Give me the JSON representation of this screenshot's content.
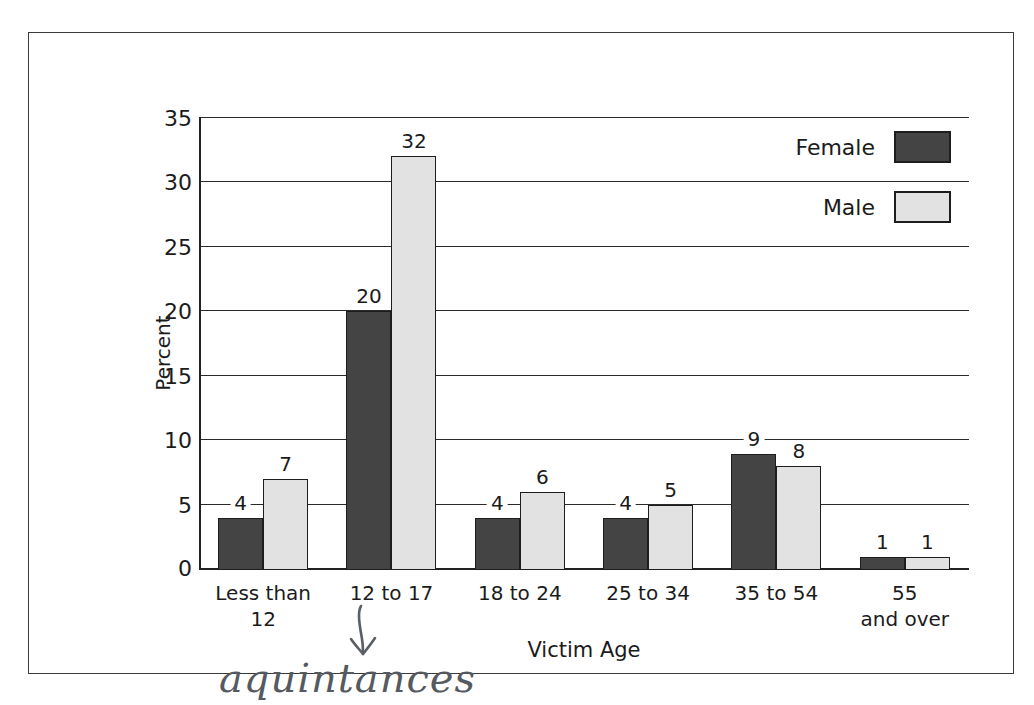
{
  "chart_data": {
    "type": "bar",
    "title": "",
    "xlabel": "Victim Age",
    "ylabel": "Percent",
    "ylim": [
      0,
      35
    ],
    "yticks": [
      0,
      5,
      10,
      15,
      20,
      25,
      30,
      35
    ],
    "grid": true,
    "legend_position": "top-right",
    "categories": [
      "Less than 12",
      "12 to 17",
      "18 to 24",
      "25 to 34",
      "35 to 54",
      "55 and over"
    ],
    "category_lines": [
      [
        "Less than",
        "12"
      ],
      [
        "12 to 17",
        ""
      ],
      [
        "18 to 24",
        ""
      ],
      [
        "25 to 34",
        ""
      ],
      [
        "35 to 54",
        ""
      ],
      [
        "55",
        "and over"
      ]
    ],
    "series": [
      {
        "name": "Female",
        "color": "#444444",
        "values": [
          4,
          20,
          4,
          4,
          9,
          1
        ]
      },
      {
        "name": "Male",
        "color": "#e2e2e2",
        "values": [
          7,
          32,
          6,
          5,
          8,
          1
        ]
      }
    ]
  },
  "legend": {
    "items": [
      {
        "label": "Female",
        "swatch": "female"
      },
      {
        "label": "Male",
        "swatch": "male"
      }
    ]
  },
  "annotation": {
    "handwritten_text": "aquintances",
    "arrow": "down-arrow",
    "points_to": "12 to 17"
  },
  "colors": {
    "female_bar": "#444444",
    "male_bar": "#e2e2e2",
    "axis": "#222222",
    "frame": "#3a3a3a",
    "handwriting": "#555a60"
  }
}
